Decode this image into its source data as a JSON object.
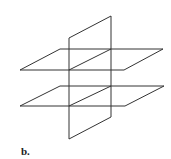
{
  "figure": {
    "caption": "b.",
    "stroke_color": "#333333",
    "shapes": [
      {
        "name": "vertical-plane",
        "points": [
          [
            69,
            38
          ],
          [
            111,
            16
          ],
          [
            111,
            117
          ],
          [
            69,
            139
          ]
        ]
      },
      {
        "name": "top-horizontal-plane",
        "points": [
          [
            20,
            70
          ],
          [
            60,
            49
          ],
          [
            163,
            49
          ],
          [
            124,
            70
          ]
        ]
      },
      {
        "name": "bottom-horizontal-plane",
        "points": [
          [
            20,
            106
          ],
          [
            60,
            86
          ],
          [
            164,
            86
          ],
          [
            125,
            106
          ]
        ]
      }
    ],
    "intersection_lines": [
      {
        "name": "top-intersection",
        "from": [
          69,
          70
        ],
        "to": [
          111,
          49
        ]
      },
      {
        "name": "bottom-intersection",
        "from": [
          69,
          106
        ],
        "to": [
          111,
          86
        ]
      }
    ]
  }
}
